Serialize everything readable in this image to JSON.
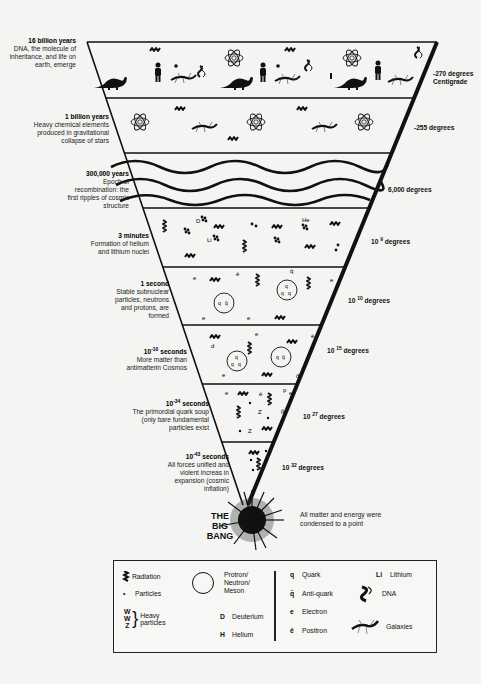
{
  "diagram": {
    "type": "inverted-triangle timeline of the universe",
    "eras": [
      {
        "time": "16 billion years",
        "desc": "DNA, the molecule of inheritance, and life on earth, emerge",
        "temp": "-270 degrees",
        "temp2": "Centigrade"
      },
      {
        "time": "1 billion years",
        "desc": "Heavy chemical elements produced in gravitational collapse of stars",
        "temp": "-255 degrees"
      },
      {
        "time": "300,000 years",
        "desc": "Epoch of recombination: the first ripples of cosmic structure",
        "temp": "6,000 degrees"
      },
      {
        "time": "3 minutes",
        "desc": "Formation of helium and lithium nuclei",
        "temp_base": "10",
        "temp_exp": "9",
        "temp_unit": "degrees"
      },
      {
        "time": "1 second",
        "desc": "Stable subnuclear particles, neutrons and protons, are formed",
        "temp_base": "10",
        "temp_exp": "10",
        "temp_unit": "degrees"
      },
      {
        "time_base": "10",
        "time_exp": "-10",
        "time_unit": "seconds",
        "desc": "More matter than antimatterin Cosmos",
        "temp_base": "10",
        "temp_exp": "15",
        "temp_unit": "degrees"
      },
      {
        "time_base": "10",
        "time_exp": "-34",
        "time_unit": "seconds",
        "desc": "The primordial quark soup (only bare fundamental particles exist",
        "temp_base": "10",
        "temp_exp": "27",
        "temp_unit": "degrees"
      },
      {
        "time_base": "10",
        "time_exp": "-43",
        "time_unit": "seconds",
        "desc": "All forces unified and violent increas in expansion (cosmic inflation)",
        "temp_base": "10",
        "temp_exp": "32",
        "temp_unit": "degrees"
      }
    ],
    "big_bang": {
      "line1": "THE",
      "line2": "BIG",
      "line3": "BANG",
      "desc": "All matter and energy were condensed to a point"
    },
    "band_symbols": {
      "band4": {
        "D": "D",
        "He": "He",
        "Li": "Li"
      },
      "band5": {
        "e": "e",
        "ebar": "ē",
        "q": "q",
        "qbar": "q̄"
      },
      "band6": {
        "d": "d",
        "e": "e",
        "q": "q",
        "qbar": "q̄",
        "ebar": "ē",
        "dbar": "d̄"
      },
      "band7": {
        "e": "e",
        "ebar": "ē",
        "p": "p",
        "z": "Z",
        "pbar": "p̄"
      }
    }
  },
  "legend": {
    "col1": [
      {
        "sym": "radiation-wave",
        "label": "Radiation"
      },
      {
        "sym": "•",
        "label": "Particles"
      },
      {
        "sym_lines": [
          "W",
          "W",
          "Z"
        ],
        "label_lines": [
          "Heavy",
          "particles"
        ]
      }
    ],
    "col2": [
      {
        "sym": "circle",
        "label_lines": [
          "Protron/",
          "Neutron/",
          "Meson"
        ]
      },
      {
        "sym": "D",
        "label": "Deuterium"
      },
      {
        "sym": "H",
        "label": "Helium"
      }
    ],
    "col3": [
      {
        "sym": "q",
        "label": "Quark"
      },
      {
        "sym": "q̄",
        "label": "Anti-quark"
      },
      {
        "sym": "e",
        "label": "Electron"
      },
      {
        "sym": "ē",
        "label": "Positron"
      }
    ],
    "col4": [
      {
        "sym": "Li",
        "label": "Lithium"
      },
      {
        "sym": "dna-glyph",
        "label": "DNA"
      },
      {
        "sym": "galaxy-glyph",
        "label": "Galaxies"
      }
    ]
  }
}
